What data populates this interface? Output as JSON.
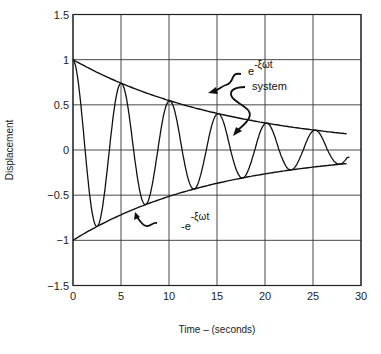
{
  "chart_data": {
    "type": "line",
    "title": "",
    "xlabel": "Time  –  (seconds)",
    "ylabel": "Displacement",
    "xlim": [
      0,
      30
    ],
    "ylim": [
      -1.5,
      1.5
    ],
    "x_ticks": [
      "0",
      "5",
      "10",
      "15",
      "20",
      "25",
      "30"
    ],
    "y_ticks": [
      "1.5",
      "1",
      "0.5",
      "0",
      "−0.5",
      "−1",
      "−1.5"
    ],
    "grid": true,
    "legend": null,
    "series": [
      {
        "name": "system",
        "description": "damped oscillation",
        "x": [
          0,
          2.9,
          5.2,
          7.8,
          10.2,
          12.8,
          15.2,
          17.8,
          20.2,
          22.8,
          25.2,
          27.8,
          28.5
        ],
        "values": [
          1.0,
          -0.83,
          0.7,
          -0.6,
          0.5,
          -0.44,
          0.38,
          -0.32,
          0.27,
          -0.24,
          0.21,
          -0.15,
          -0.12
        ]
      },
      {
        "name": "upper envelope",
        "label": "e^{-ξωt}",
        "x": [
          0,
          5,
          10,
          15,
          20,
          25,
          28.5
        ],
        "values": [
          1.0,
          0.74,
          0.55,
          0.41,
          0.3,
          0.22,
          0.18
        ]
      },
      {
        "name": "lower envelope",
        "label": "-e^{-ξωt}",
        "x": [
          0,
          5,
          10,
          15,
          20,
          25,
          28.5
        ],
        "values": [
          -1.0,
          -0.74,
          -0.55,
          -0.41,
          -0.3,
          -0.22,
          -0.15
        ]
      }
    ],
    "annotations": [
      {
        "text": "e",
        "superscript": "-ξωt",
        "points_to": "upper envelope"
      },
      {
        "text": "system",
        "points_to": "damped oscillation"
      },
      {
        "text": "-e",
        "superscript": "-ξωt",
        "points_to": "lower envelope"
      }
    ]
  },
  "labels": {
    "xlabel": "Time  –  (seconds)",
    "ylabel": "Displacement",
    "upper_env_base": "e",
    "upper_env_sup": "-ξωt",
    "lower_env_base": "-e",
    "lower_env_sup": "-ξωt",
    "system": "system"
  }
}
